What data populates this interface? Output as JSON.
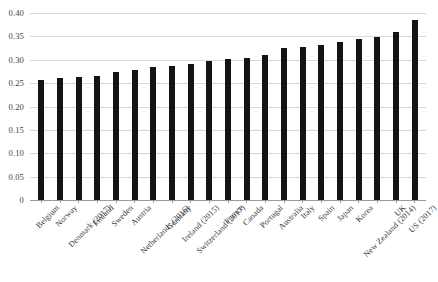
{
  "chart_data": {
    "type": "bar",
    "title": "",
    "subtitle": "",
    "xlabel": "",
    "ylabel": "",
    "ylim": [
      0,
      0.4
    ],
    "ytick_labels": [
      "0.40",
      "0.35",
      "0.30",
      "0.25",
      "0.20",
      "0.15",
      "0.10",
      "0.05",
      "0"
    ],
    "ytick_values": [
      0.4,
      0.35,
      0.3,
      0.25,
      0.2,
      0.15,
      0.1,
      0.05,
      0
    ],
    "grid": "horizontal",
    "legend": "none",
    "bar_color": "#141414",
    "gridline_color": "#d9d9d9",
    "axis_color": "#9b9b9b",
    "background_color": "#ffffff",
    "categories": [
      "Belgium",
      "Norway",
      "Denmark (2017)",
      "Finland",
      "Sweden",
      "Austria",
      "Netherlands (2016)",
      "Germany",
      "Ireland (2015)",
      "Switzerland (2017)",
      "France",
      "Canada",
      "Portugal",
      "Australia",
      "Italy",
      "Spain",
      "Japan",
      "Korea",
      "New Zealand (2014)",
      "UK",
      "US (2017)"
    ],
    "values": [
      0.257,
      0.26,
      0.263,
      0.266,
      0.274,
      0.279,
      0.284,
      0.287,
      0.291,
      0.297,
      0.301,
      0.303,
      0.31,
      0.325,
      0.328,
      0.331,
      0.337,
      0.345,
      0.349,
      0.36,
      0.385
    ]
  }
}
